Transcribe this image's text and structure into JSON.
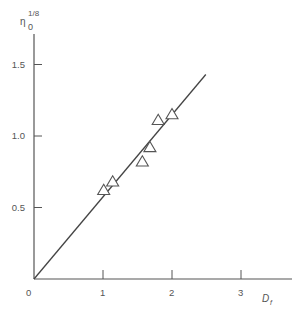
{
  "chart_data": {
    "type": "scatter",
    "title": "",
    "xlabel": "D_f",
    "ylabel": "η_0^(1/8)",
    "ylabel_parts": {
      "symbol": "η",
      "subscript": "0",
      "superscript": "1/8"
    },
    "xlabel_parts": {
      "symbol": "D",
      "subscript": "f"
    },
    "origin_label": "0",
    "xlim": [
      0,
      3.6
    ],
    "ylim": [
      0,
      1.6
    ],
    "x_ticks": [
      1,
      2,
      3
    ],
    "x_tick_labels": [
      "1",
      "2",
      "3"
    ],
    "y_ticks": [
      0.5,
      1.0,
      1.5
    ],
    "y_tick_labels": [
      "0.5",
      "1.0",
      "1.5"
    ],
    "grid": false,
    "legend": null,
    "series": [
      {
        "name": "data",
        "marker": "open-triangle",
        "points": [
          {
            "x": 1.01,
            "y": 0.62
          },
          {
            "x": 1.14,
            "y": 0.68
          },
          {
            "x": 1.57,
            "y": 0.82
          },
          {
            "x": 1.68,
            "y": 0.92
          },
          {
            "x": 1.8,
            "y": 1.11
          },
          {
            "x": 2.0,
            "y": 1.15
          }
        ]
      },
      {
        "name": "fit line",
        "type": "line",
        "points": [
          {
            "x": 0,
            "y": 0
          },
          {
            "x": 2.49,
            "y": 1.43
          }
        ]
      }
    ]
  }
}
